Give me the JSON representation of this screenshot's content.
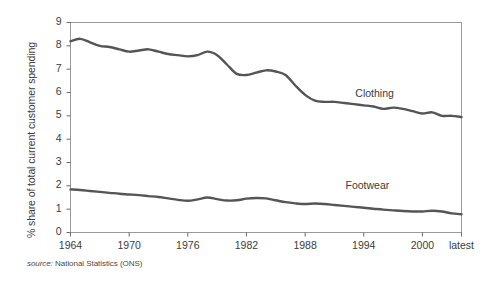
{
  "chart_data": {
    "type": "line",
    "title": "",
    "xlabel": "",
    "ylabel": "% share of total current customer spending",
    "source": "National Statistics (ONS)",
    "source_prefix": "source:",
    "grid": false,
    "legend_position": "inline-labels",
    "xlim": [
      1964,
      2004
    ],
    "ylim": [
      0,
      9
    ],
    "ytick_labels": [
      "0",
      "1",
      "2",
      "3",
      "4",
      "5",
      "6",
      "7",
      "8",
      "9"
    ],
    "ytick_values": [
      0,
      1,
      2,
      3,
      4,
      5,
      6,
      7,
      8,
      9
    ],
    "xtick_labels": [
      "1964",
      "1970",
      "1976",
      "1982",
      "1988",
      "1994",
      "2000",
      "latest"
    ],
    "xtick_values": [
      1964,
      1970,
      1976,
      1982,
      1988,
      1994,
      2000,
      2004
    ],
    "x": [
      1964,
      1965,
      1966,
      1967,
      1968,
      1969,
      1970,
      1971,
      1972,
      1973,
      1974,
      1975,
      1976,
      1977,
      1978,
      1979,
      1980,
      1981,
      1982,
      1983,
      1984,
      1985,
      1986,
      1987,
      1988,
      1989,
      1990,
      1991,
      1992,
      1993,
      1994,
      1995,
      1996,
      1997,
      1998,
      1999,
      2000,
      2001,
      2002,
      2003,
      2004
    ],
    "series": [
      {
        "name": "Clothing",
        "color": "#555555",
        "values": [
          8.2,
          8.3,
          8.15,
          8.0,
          7.95,
          7.85,
          7.75,
          7.8,
          7.85,
          7.75,
          7.65,
          7.6,
          7.55,
          7.6,
          7.75,
          7.6,
          7.2,
          6.8,
          6.75,
          6.85,
          6.95,
          6.9,
          6.75,
          6.3,
          5.9,
          5.65,
          5.6,
          5.6,
          5.55,
          5.5,
          5.45,
          5.4,
          5.3,
          5.35,
          5.3,
          5.2,
          5.1,
          5.15,
          5.0,
          5.0,
          4.95
        ]
      },
      {
        "name": "Footwear",
        "color": "#555555",
        "values": [
          1.85,
          1.82,
          1.78,
          1.74,
          1.7,
          1.66,
          1.63,
          1.6,
          1.56,
          1.52,
          1.46,
          1.4,
          1.36,
          1.42,
          1.5,
          1.43,
          1.37,
          1.38,
          1.45,
          1.48,
          1.46,
          1.38,
          1.3,
          1.25,
          1.22,
          1.24,
          1.22,
          1.18,
          1.14,
          1.1,
          1.06,
          1.02,
          0.98,
          0.95,
          0.92,
          0.9,
          0.9,
          0.93,
          0.9,
          0.82,
          0.78
        ]
      }
    ],
    "annotations": [
      {
        "text": "Clothing",
        "x": 1996,
        "y": 5.9
      },
      {
        "text": "Footwear",
        "x": 1995,
        "y": 1.95
      }
    ]
  },
  "axes": {
    "plot_border_color": "#9a9a9a",
    "tick_color": "#6a6a6a"
  }
}
